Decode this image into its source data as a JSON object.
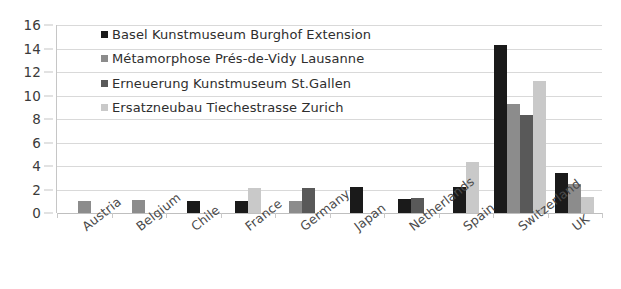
{
  "chart_data": {
    "type": "bar",
    "title": "",
    "xlabel": "",
    "ylabel": "",
    "ylim": [
      0,
      16
    ],
    "ytick_step": 2,
    "yticks": [
      16,
      14,
      12,
      10,
      8,
      6,
      4,
      2,
      0
    ],
    "grid": true,
    "legend_position": "upper-left-inside",
    "categories": [
      "Austria",
      "Belgium",
      "Chile",
      "France",
      "Germany",
      "Japan",
      "Netherlands",
      "Spain",
      "Switzerland",
      "UK"
    ],
    "series": [
      {
        "name": "Basel Kunstmuseum Burghof Extension",
        "color": "#1a1a1a",
        "values": [
          null,
          null,
          1.0,
          1.0,
          null,
          2.2,
          1.2,
          2.2,
          14.3,
          3.4
        ]
      },
      {
        "name": "Métamorphose Prés-de-Vidy Lausanne",
        "color": "#8c8c8c",
        "values": [
          1.0,
          1.1,
          null,
          null,
          1.0,
          null,
          null,
          null,
          9.3,
          2.5
        ]
      },
      {
        "name": "Erneuerung Kunstmuseum St.Gallen",
        "color": "#595959",
        "values": [
          null,
          null,
          null,
          null,
          2.1,
          null,
          1.3,
          null,
          8.3,
          null
        ]
      },
      {
        "name": "Ersatzneubau Tiechestrasse Zurich",
        "color": "#c9c9c9",
        "values": [
          null,
          null,
          null,
          2.1,
          null,
          null,
          null,
          4.3,
          11.2,
          1.4
        ]
      }
    ]
  },
  "legend": {
    "entries": [
      {
        "label": "Basel Kunstmuseum Burghof Extension",
        "color": "#1a1a1a"
      },
      {
        "label": "Métamorphose Prés-de-Vidy Lausanne",
        "color": "#8c8c8c"
      },
      {
        "label": "Erneuerung Kunstmuseum St.Gallen",
        "color": "#595959"
      },
      {
        "label": "Ersatzneubau Tiechestrasse Zurich",
        "color": "#c9c9c9"
      }
    ]
  }
}
